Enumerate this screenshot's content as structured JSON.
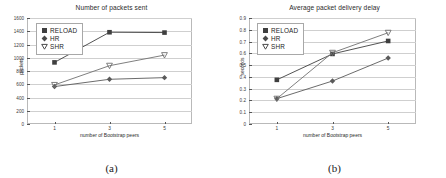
{
  "figure": {
    "panels": [
      {
        "id": "a",
        "subcaption": "(a)",
        "title": "Number of packets sent",
        "xlabel": "number of Bootstrap peers",
        "ylabel": "packets",
        "yticks": [
          "0",
          "200",
          "400",
          "600",
          "800",
          "1000",
          "1200",
          "1400",
          "1600"
        ],
        "xticks": [
          "1",
          "3",
          "5"
        ],
        "legend": [
          "RELOAD",
          "HR",
          "SHR"
        ]
      },
      {
        "id": "b",
        "subcaption": "(b)",
        "title": "Average packet delivery delay",
        "xlabel": "number of Bootstrap peers",
        "ylabel": "seconds",
        "yticks": [
          "0",
          "0.1",
          "0.2",
          "0.3",
          "0.4",
          "0.5",
          "0.6",
          "0.7",
          "0.8",
          "0.9"
        ],
        "xticks": [
          "1",
          "3",
          "5"
        ],
        "legend": [
          "RELOAD",
          "HR",
          "SHR"
        ]
      }
    ]
  },
  "chart_data": [
    {
      "type": "line",
      "title": "Number of packets sent",
      "xlabel": "number of Bootstrap peers",
      "ylabel": "packets",
      "categories": [
        1,
        3,
        5
      ],
      "xlim": [
        0,
        6
      ],
      "ylim": [
        0,
        1600
      ],
      "yticks": [
        0,
        200,
        400,
        600,
        800,
        1000,
        1200,
        1400,
        1600
      ],
      "grid": true,
      "legend_position": "upper-left",
      "series": [
        {
          "name": "RELOAD",
          "marker": "square",
          "color": "#3f3f3f",
          "values": [
            930,
            1385,
            1380
          ]
        },
        {
          "name": "HR",
          "marker": "diamond",
          "color": "#5a5a5a",
          "values": [
            565,
            675,
            700
          ]
        },
        {
          "name": "SHR",
          "marker": "triangle-down",
          "color": "#707070",
          "values": [
            590,
            880,
            1040
          ]
        }
      ]
    },
    {
      "type": "line",
      "title": "Average packet delivery delay",
      "xlabel": "number of Bootstrap peers",
      "ylabel": "seconds",
      "categories": [
        1,
        3,
        5
      ],
      "xlim": [
        0,
        6
      ],
      "ylim": [
        0,
        0.9
      ],
      "yticks": [
        0,
        0.1,
        0.2,
        0.3,
        0.4,
        0.5,
        0.6,
        0.7,
        0.8,
        0.9
      ],
      "grid": true,
      "legend_position": "upper-left",
      "series": [
        {
          "name": "RELOAD",
          "marker": "square",
          "color": "#3f3f3f",
          "values": [
            0.375,
            0.595,
            0.705
          ]
        },
        {
          "name": "HR",
          "marker": "diamond",
          "color": "#5a5a5a",
          "values": [
            0.215,
            0.365,
            0.56
          ]
        },
        {
          "name": "SHR",
          "marker": "triangle-down",
          "color": "#707070",
          "values": [
            0.215,
            0.605,
            0.775
          ]
        }
      ]
    }
  ]
}
